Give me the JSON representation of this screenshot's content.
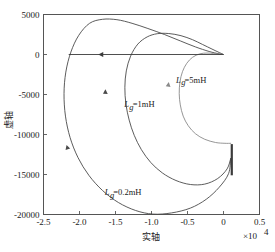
{
  "chart_data": {
    "type": "line",
    "title": "",
    "subtitle": "",
    "xlabel": "实轴",
    "ylabel": "虚轴",
    "x_multiplier": "×10⁴",
    "x_multiplier_base": "×10",
    "x_multiplier_exp": "4",
    "xlim": [
      -25000,
      5000
    ],
    "ylim": [
      -20000,
      5000
    ],
    "xticks": [
      -25000,
      -20000,
      -15000,
      -10000,
      -5000,
      0,
      5000
    ],
    "xtick_labels": [
      "-2.5",
      "-2.0",
      "-1.5",
      "-1.0",
      "-0.5",
      "0",
      "0.5"
    ],
    "yticks": [
      5000,
      0,
      -5000,
      -10000,
      -15000,
      -20000
    ],
    "ytick_labels": [
      "5000",
      "0",
      "-5000",
      "-10000",
      "-15000",
      "-20000"
    ],
    "grid": false,
    "legend_position": "inline-annotations",
    "series": [
      {
        "name": "Lg=0.2mH",
        "label_text": "=0.2mH",
        "label_symbol": "L",
        "label_sub": "g",
        "color": "#4a4a4a",
        "label_x": -16500,
        "label_y": -17600,
        "arrow_x": -21800,
        "arrow_y": -11300,
        "points": [
          [
            1000,
            -13000
          ],
          [
            700,
            -14900
          ],
          [
            -600,
            -16600
          ],
          [
            -2400,
            -18100
          ],
          [
            -4600,
            -19200
          ],
          [
            -7200,
            -19800
          ],
          [
            -9800,
            -19950
          ],
          [
            -12200,
            -19500
          ],
          [
            -14600,
            -18500
          ],
          [
            -16800,
            -17000
          ],
          [
            -18700,
            -15100
          ],
          [
            -20200,
            -12900
          ],
          [
            -21300,
            -10400
          ],
          [
            -21950,
            -7700
          ],
          [
            -22150,
            -4900
          ],
          [
            -21900,
            -2200
          ],
          [
            -21200,
            300
          ],
          [
            -20100,
            2400
          ],
          [
            -18600,
            3900
          ],
          [
            -16800,
            4400
          ],
          [
            -14800,
            4350
          ],
          [
            -12700,
            3900
          ],
          [
            -10500,
            3250
          ],
          [
            -8200,
            2500
          ],
          [
            -6000,
            1700
          ],
          [
            -3900,
            950
          ],
          [
            -2000,
            380
          ],
          [
            -600,
            80
          ],
          [
            0,
            0
          ]
        ]
      },
      {
        "name": "Lg=1mH",
        "label_text": "=1mH",
        "label_symbol": "L",
        "label_sub": "g",
        "color": "#4a4a4a",
        "label_x": -13800,
        "label_y": -6600,
        "arrow_x": -16400,
        "arrow_y": -4350,
        "points": [
          [
            1000,
            -13000
          ],
          [
            500,
            -14300
          ],
          [
            -800,
            -15500
          ],
          [
            -2600,
            -16200
          ],
          [
            -4600,
            -16250
          ],
          [
            -6600,
            -15750
          ],
          [
            -8500,
            -14800
          ],
          [
            -10100,
            -13500
          ],
          [
            -11400,
            -11900
          ],
          [
            -12400,
            -10100
          ],
          [
            -13100,
            -8200
          ],
          [
            -13550,
            -6200
          ],
          [
            -13700,
            -4100
          ],
          [
            -13500,
            -2050
          ],
          [
            -12900,
            -200
          ],
          [
            -11900,
            1300
          ],
          [
            -10600,
            2200
          ],
          [
            -9200,
            2600
          ],
          [
            -7600,
            2620
          ],
          [
            -5900,
            2350
          ],
          [
            -4300,
            1850
          ],
          [
            -2900,
            1250
          ],
          [
            -1600,
            680
          ],
          [
            -600,
            250
          ],
          [
            0,
            0
          ]
        ]
      },
      {
        "name": "Lg=5mH",
        "label_text": "=5mH",
        "label_symbol": "L",
        "label_sub": "g",
        "color": "#8a8a8a",
        "label_x": -6600,
        "label_y": -3550,
        "arrow_x": -7600,
        "arrow_y": -3450,
        "points": [
          [
            1000,
            -11100
          ],
          [
            200,
            -11100
          ],
          [
            -1100,
            -11000
          ],
          [
            -2600,
            -10600
          ],
          [
            -3900,
            -9900
          ],
          [
            -4900,
            -8900
          ],
          [
            -5600,
            -7700
          ],
          [
            -6000,
            -6300
          ],
          [
            -6150,
            -4900
          ],
          [
            -6050,
            -3450
          ],
          [
            -5700,
            -2150
          ],
          [
            -5100,
            -1100
          ],
          [
            -4300,
            -350
          ],
          [
            -3300,
            80
          ],
          [
            -2300,
            180
          ],
          [
            -1400,
            130
          ],
          [
            -600,
            50
          ],
          [
            0,
            0
          ]
        ]
      }
    ],
    "annotations": [
      {
        "name": "real-axis-locus",
        "type": "segment-with-arrow",
        "from": [
          0,
          0
        ],
        "to": [
          -21500,
          0
        ],
        "arrow_at": [
          -17400,
          0
        ],
        "arrow_direction": "left",
        "color": "#3b3b3b"
      },
      {
        "name": "vertical-branch",
        "type": "segment",
        "from": [
          1150,
          -11200
        ],
        "to": [
          1150,
          -15100
        ],
        "color": "#3b3b3b"
      }
    ]
  },
  "figure": {
    "frame_color": "#555555",
    "background": "#ffffff"
  }
}
